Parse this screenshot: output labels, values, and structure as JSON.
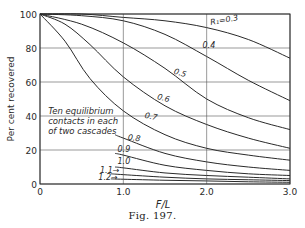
{
  "figure": {
    "caption": "Fig. 197."
  },
  "chart_data": {
    "type": "line",
    "title": "",
    "xlabel": "F/L",
    "ylabel": "Per cent recovered",
    "xlim": [
      0,
      3.0
    ],
    "ylim": [
      0,
      100
    ],
    "x_ticks": [
      "0",
      "1.0",
      "2.0",
      "3.0"
    ],
    "y_ticks": [
      "0",
      "20",
      "40",
      "60",
      "80",
      "100"
    ],
    "grid": true,
    "annotation": [
      "Ten equilibrium",
      "contacts in each",
      "of two cascades"
    ],
    "series": [
      {
        "name": "R1=0.3",
        "label": "R₁=0.3",
        "x": [
          0,
          0.5,
          1.0,
          1.5,
          2.0,
          2.5,
          3.0
        ],
        "y": [
          100,
          100,
          98,
          96,
          92,
          85,
          74
        ]
      },
      {
        "name": "0.4",
        "label": "0.4",
        "x": [
          0,
          0.5,
          1.0,
          1.5,
          2.0,
          2.5,
          3.0
        ],
        "y": [
          100,
          99,
          96,
          88,
          75,
          61,
          49
        ]
      },
      {
        "name": "0.5",
        "label": "0.5",
        "x": [
          0,
          0.5,
          1.0,
          1.5,
          2.0,
          2.5,
          3.0
        ],
        "y": [
          100,
          94,
          83,
          68,
          50,
          39,
          32
        ]
      },
      {
        "name": "0.6",
        "label": "0.6",
        "x": [
          0,
          0.3,
          0.6,
          1.0,
          1.5,
          2.0,
          2.5,
          3.0
        ],
        "y": [
          100,
          94,
          82,
          63,
          46,
          35,
          27,
          21
        ]
      },
      {
        "name": "0.7",
        "label": "0.7",
        "x": [
          0,
          0.3,
          0.6,
          1.0,
          1.5,
          2.0,
          2.5,
          3.0
        ],
        "y": [
          100,
          84,
          62,
          43,
          29,
          21,
          17,
          14
        ]
      },
      {
        "name": "0.8",
        "label": "0.8",
        "x": [
          0.9,
          1.0,
          1.5,
          2.0,
          2.5,
          3.0
        ],
        "y": [
          29,
          27,
          18,
          13,
          10,
          8
        ]
      },
      {
        "name": "0.9",
        "label": "0.9",
        "x": [
          0.9,
          1.0,
          1.5,
          2.0,
          2.5,
          3.0
        ],
        "y": [
          18,
          17,
          11,
          8,
          6,
          5
        ]
      },
      {
        "name": "1.0",
        "label": "1.0",
        "x": [
          0.9,
          1.0,
          1.5,
          2.0,
          2.5,
          3.0
        ],
        "y": [
          10,
          9.5,
          6.5,
          5,
          4,
          3
        ]
      },
      {
        "name": "1.1",
        "label": "1.1",
        "x": [
          0.85,
          1.0,
          1.5,
          2.0,
          2.5,
          3.0
        ],
        "y": [
          6,
          5.5,
          4,
          3,
          2.5,
          2
        ]
      },
      {
        "name": "1.2",
        "label": "1.2",
        "x": [
          0.85,
          1.0,
          1.5,
          2.0,
          2.5,
          3.0
        ],
        "y": [
          3,
          2.8,
          2.2,
          1.8,
          1.3,
          1
        ]
      }
    ]
  }
}
